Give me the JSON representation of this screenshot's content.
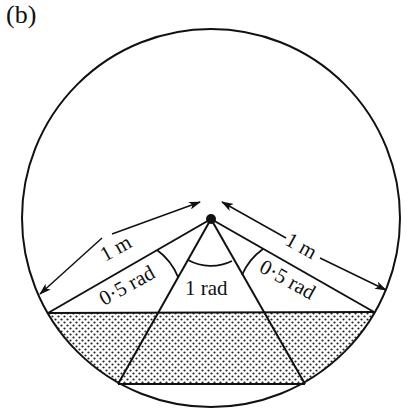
{
  "figure": {
    "panel_label": "(b)",
    "labels": {
      "radius_left": "1 m",
      "radius_right": "1 m",
      "angle_left": "0·5 rad",
      "angle_center": "1 rad",
      "angle_right": "0·5 rad"
    },
    "colors": {
      "stroke": "#111111",
      "background": "#ffffff",
      "stipple": "#222222"
    }
  }
}
